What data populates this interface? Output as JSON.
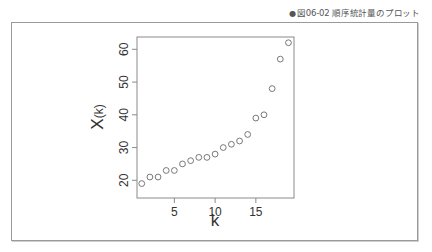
{
  "caption": {
    "bullet": "●",
    "text": "図06-02 順序統計量のプロット"
  },
  "chart_data": {
    "type": "scatter",
    "title": "",
    "xlabel": "k",
    "ylabel": "X(k)",
    "ylabel_main": "X",
    "ylabel_sub": "(k)",
    "x": [
      1,
      2,
      3,
      4,
      5,
      6,
      7,
      8,
      9,
      10,
      11,
      12,
      13,
      14,
      15,
      16,
      17,
      18,
      19
    ],
    "y": [
      19,
      21,
      21,
      23,
      23,
      25,
      26,
      27,
      27,
      28,
      30,
      31,
      32,
      34,
      39,
      40,
      48,
      57,
      62
    ],
    "xticks": [
      5,
      10,
      15
    ],
    "yticks": [
      20,
      30,
      40,
      50,
      60
    ],
    "xlim": [
      0.3,
      19.7
    ],
    "ylim": [
      18,
      64
    ],
    "grid": false,
    "legend": null,
    "marker": "open-circle"
  }
}
